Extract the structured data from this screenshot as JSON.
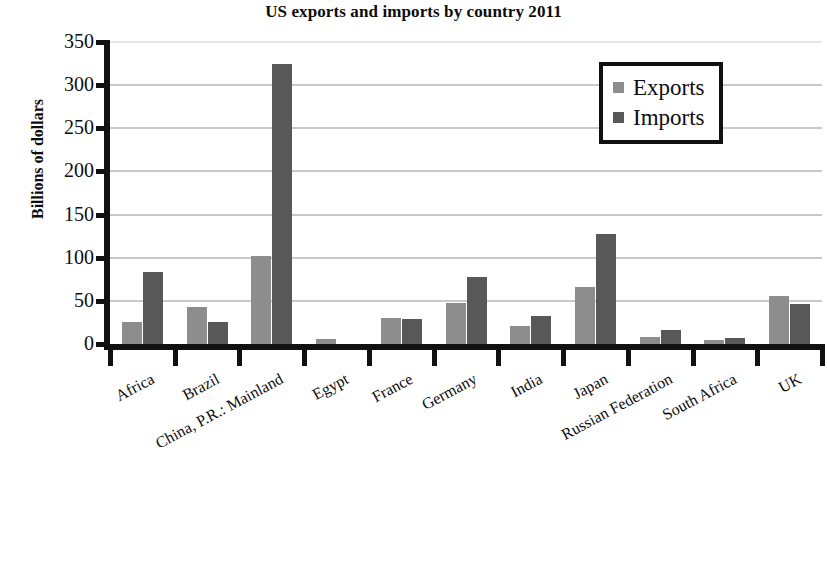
{
  "chart_data": {
    "type": "bar",
    "title": "US exports and imports by country 2011",
    "xlabel": "",
    "ylabel": "Billions of dollars",
    "categories": [
      "Africa",
      "Brazil",
      "China, P.R.: Mainland",
      "Egypt",
      "France",
      "Germany",
      "India",
      "Japan",
      "Russian Federation",
      "South Africa",
      "UK"
    ],
    "series": [
      {
        "name": "Exports",
        "color": "#8d8d8d",
        "values": [
          26,
          43,
          102,
          6,
          30,
          48,
          21,
          66,
          8,
          5,
          56
        ]
      },
      {
        "name": "Imports",
        "color": "#585858",
        "values": [
          83,
          25,
          325,
          0,
          29,
          78,
          32,
          127,
          16,
          7,
          46
        ]
      }
    ],
    "ylim": [
      0,
      350
    ],
    "yticks": [
      0,
      50,
      100,
      150,
      200,
      250,
      300,
      350
    ],
    "ytick_labels": [
      "0",
      "50",
      "100",
      "150",
      "200",
      "250",
      "300",
      "350"
    ],
    "grid": true,
    "legend_position": "top-right",
    "legend_entries": [
      "Exports",
      "Imports"
    ]
  }
}
